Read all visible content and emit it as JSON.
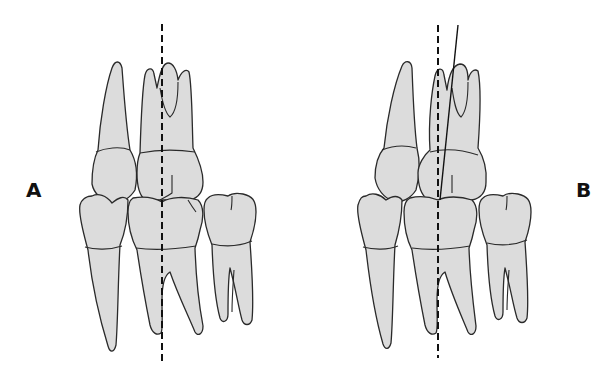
{
  "figure": {
    "panels": [
      {
        "id": "A",
        "label": "A",
        "description": "Maxillary and mandibular teeth in occlusion; vertical dashed reference axis through molar cusp contact",
        "axes": [
          {
            "type": "dashed",
            "from": [
              162,
              24
            ],
            "to": [
              162,
              365
            ]
          }
        ]
      },
      {
        "id": "B",
        "label": "B",
        "description": "Same occlusion with dashed vertical reference axis and solid tilted long axis of upper molar",
        "axes": [
          {
            "type": "dashed",
            "from": [
              438,
              25
            ],
            "to": [
              438,
              358
            ]
          },
          {
            "type": "solid",
            "from": [
              458,
              25
            ],
            "to": [
              440,
              200
            ]
          }
        ]
      }
    ],
    "colors": {
      "tooth_fill": "#dcdcdc",
      "outline": "#2a2a2a",
      "axis": "#111111",
      "background": "#ffffff"
    }
  }
}
